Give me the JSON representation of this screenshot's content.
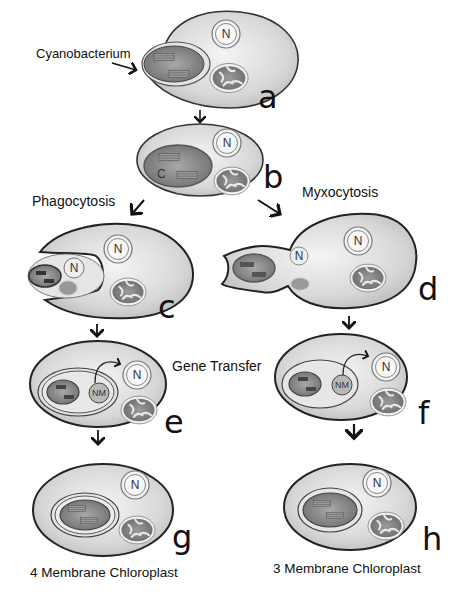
{
  "diagram": {
    "labels": {
      "cyanobacterium": "Cyanobacterium",
      "phagocytosis": "Phagocytosis",
      "myxocytosis": "Myxocytosis",
      "gene_transfer": "Gene Transfer",
      "four_membrane": "4 Membrane Chloroplast",
      "three_membrane": "3 Membrane Chloroplast"
    },
    "stages": {
      "a": "a",
      "b": "b",
      "c": "c",
      "d": "d",
      "e": "e",
      "f": "f",
      "g": "g",
      "h": "h"
    },
    "organelles": {
      "nucleus": "N",
      "chloroplast": "C",
      "nucleomorph": "NM"
    },
    "colors": {
      "cell_fill": "#dcdcdc",
      "cell_stroke": "#222222",
      "chloroplast_fill": "#8a8a8a",
      "mitochondrion_fill": "#7a7a7a",
      "background": "#ffffff"
    }
  }
}
